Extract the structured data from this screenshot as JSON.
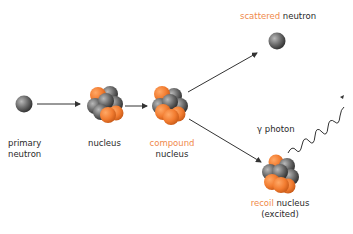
{
  "diagram": {
    "type": "neutron inelastic scattering via compound nucleus",
    "colors": {
      "accent": "#f08a4b",
      "neutral": "#5a5a5a",
      "text": "#2a2a2a",
      "arrow": "#333333"
    },
    "nodes": [
      {
        "id": "primary_neutron",
        "label_line1": "primary",
        "label_line2": "neutron"
      },
      {
        "id": "nucleus",
        "label": "nucleus"
      },
      {
        "id": "compound_nucleus",
        "label_highlight": "compound",
        "label_line2": "nucleus"
      },
      {
        "id": "scattered_neutron",
        "label_highlight": "scattered",
        "label_rest": " neutron"
      },
      {
        "id": "recoil_nucleus",
        "label_highlight": "recoil",
        "label_rest": " nucleus",
        "label_line2": "(excited)"
      },
      {
        "id": "gamma_photon",
        "label": "γ photon"
      }
    ],
    "edges": [
      {
        "from": "primary_neutron",
        "to": "nucleus"
      },
      {
        "from": "nucleus",
        "to": "compound_nucleus"
      },
      {
        "from": "compound_nucleus",
        "to": "scattered_neutron"
      },
      {
        "from": "compound_nucleus",
        "to": "recoil_nucleus"
      },
      {
        "from": "recoil_nucleus",
        "to": "gamma_photon",
        "style": "wavy"
      }
    ]
  }
}
